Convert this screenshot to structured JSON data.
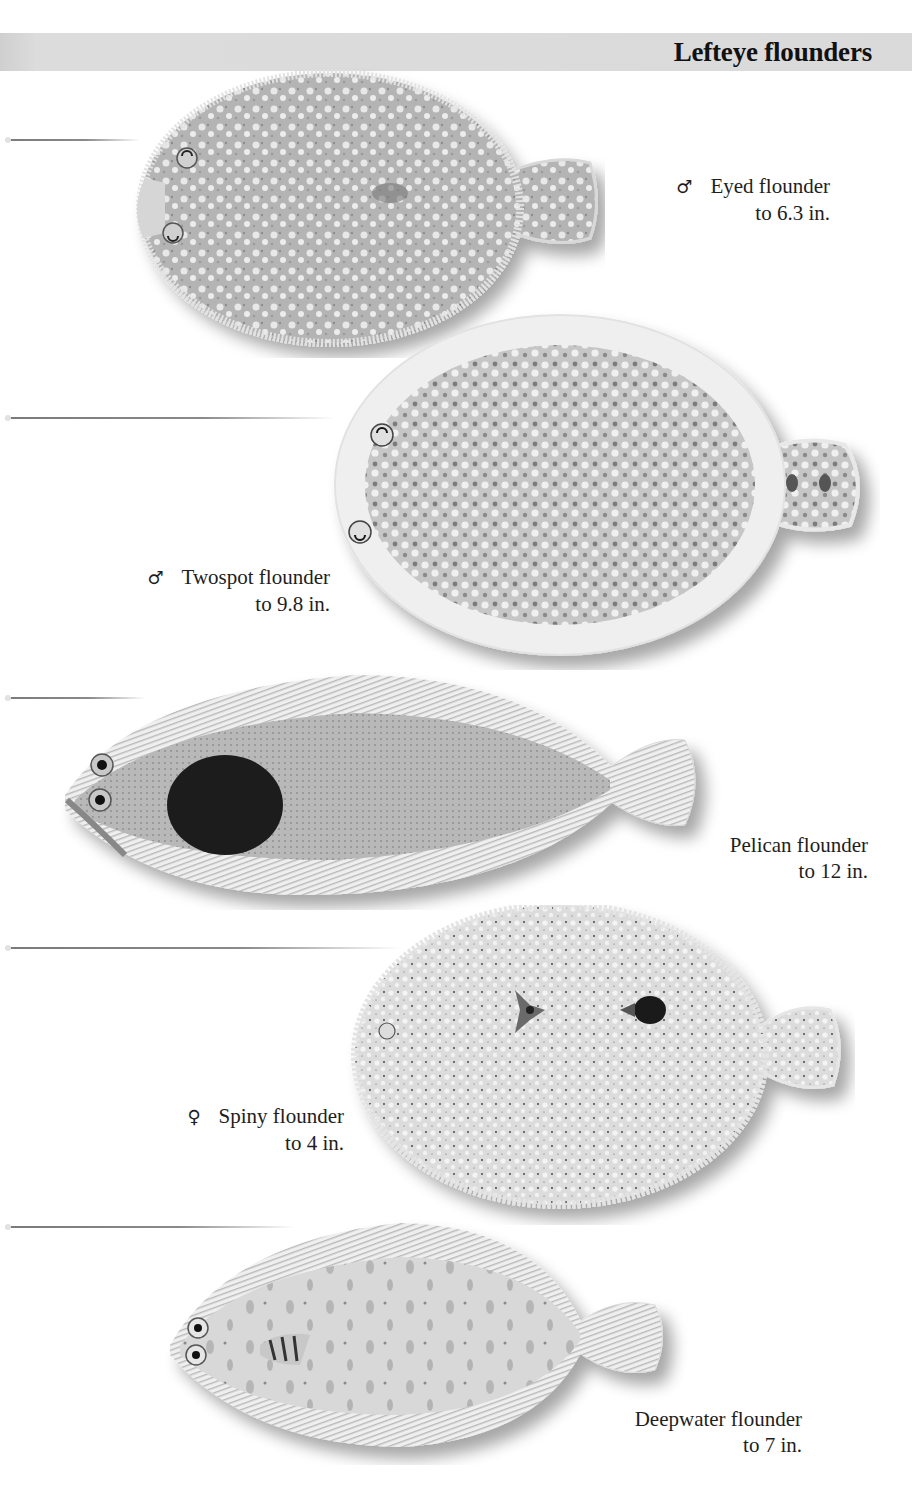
{
  "header": {
    "title": "Lefteye flounders",
    "bar_color": "#d9d9d9"
  },
  "species": [
    {
      "name": "Eyed flounder",
      "size": "to 6.3 in.",
      "sex_symbol": "♂",
      "sex": "male"
    },
    {
      "name": "Twospot flounder",
      "size": "to 9.8 in.",
      "sex_symbol": "♂",
      "sex": "male"
    },
    {
      "name": "Pelican flounder",
      "size": "to 12 in.",
      "sex_symbol": "",
      "sex": ""
    },
    {
      "name": "Spiny flounder",
      "size": "to 4 in.",
      "sex_symbol": "♀",
      "sex": "female"
    },
    {
      "name": "Deepwater flounder",
      "size": "to 7 in.",
      "sex_symbol": "",
      "sex": ""
    }
  ],
  "colors": {
    "body_gray": "#bdbdbd",
    "fin_gray": "#e3e3e3",
    "dark_patch": "#1c1c1c",
    "text": "#1e1e1e"
  }
}
